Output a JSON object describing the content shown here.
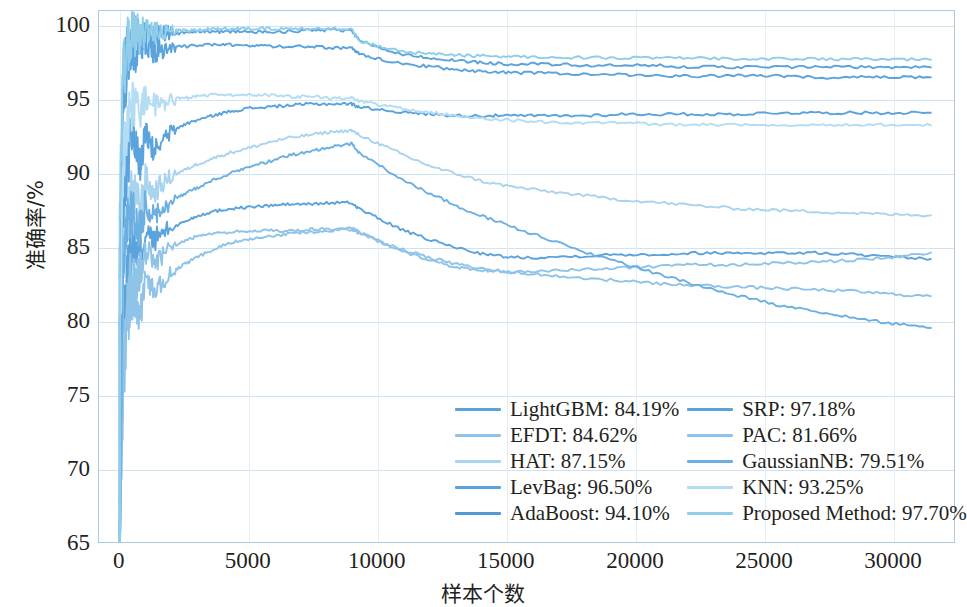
{
  "chart_data": {
    "type": "line",
    "title": "",
    "xlabel": "样本个数",
    "ylabel": "准确率/%",
    "xlim": [
      -800,
      32400
    ],
    "ylim": [
      65,
      101
    ],
    "grid": true,
    "legend_position": "lower-center-right",
    "xticks": [
      0,
      5000,
      10000,
      15000,
      20000,
      25000,
      30000
    ],
    "xtick_labels": [
      "0",
      "5000",
      "10000",
      "15000",
      "20000",
      "25000",
      "30000"
    ],
    "yticks": [
      65,
      70,
      75,
      80,
      85,
      90,
      95,
      100
    ],
    "ytick_labels": [
      "65",
      "70",
      "75",
      "80",
      "85",
      "90",
      "95",
      "100"
    ],
    "x": [
      0,
      150,
      300,
      450,
      600,
      800,
      1000,
      1300,
      1600,
      2000,
      2500,
      3000,
      3600,
      4300,
      5000,
      5800,
      6600,
      7400,
      8200,
      9000,
      9300,
      10200,
      11200,
      12200,
      13200,
      14200,
      15200,
      16500,
      18000,
      19500,
      21000,
      22500,
      24000,
      25500,
      27000,
      28500,
      30000,
      31500
    ],
    "series": [
      {
        "name": "LightGBM",
        "final_value": 84.19,
        "color": "#5ba3dc",
        "values": [
          65.0,
          80.5,
          83.2,
          84.9,
          85.0,
          84.2,
          86.0,
          85.4,
          85.9,
          86.3,
          86.7,
          87.1,
          87.4,
          87.6,
          87.7,
          87.8,
          87.9,
          87.9,
          88.0,
          88.0,
          87.6,
          86.8,
          86.0,
          85.4,
          84.9,
          84.5,
          84.3,
          84.3,
          84.4,
          84.5,
          84.5,
          84.6,
          84.6,
          84.6,
          84.6,
          84.5,
          84.3,
          84.19
        ]
      },
      {
        "name": "EFDT",
        "final_value": 84.62,
        "color": "#8fc4e8",
        "values": [
          65.0,
          78.0,
          81.4,
          83.1,
          82.6,
          83.4,
          84.9,
          84.0,
          84.3,
          85.0,
          85.4,
          85.7,
          85.9,
          86.0,
          86.1,
          86.1,
          86.1,
          86.2,
          86.2,
          86.3,
          86.0,
          85.3,
          84.6,
          84.0,
          83.6,
          83.4,
          83.3,
          83.4,
          83.5,
          83.6,
          83.7,
          83.8,
          83.8,
          83.9,
          84.0,
          84.1,
          84.3,
          84.62
        ]
      },
      {
        "name": "HAT",
        "final_value": 87.15,
        "color": "#a9d4ef",
        "values": [
          65.0,
          83.5,
          86.6,
          88.5,
          88.4,
          87.6,
          89.6,
          88.6,
          89.2,
          89.8,
          90.2,
          90.6,
          91.0,
          91.4,
          91.7,
          92.1,
          92.4,
          92.6,
          92.8,
          92.9,
          92.6,
          91.9,
          91.1,
          90.4,
          89.9,
          89.4,
          89.1,
          88.8,
          88.5,
          88.2,
          88.0,
          87.8,
          87.6,
          87.5,
          87.4,
          87.3,
          87.2,
          87.15
        ]
      },
      {
        "name": "LevBag",
        "final_value": 96.5,
        "color": "#5ba3dc",
        "values": [
          80.0,
          95.4,
          97.2,
          98.1,
          98.3,
          98.0,
          98.5,
          98.3,
          98.4,
          98.6,
          98.6,
          98.7,
          98.7,
          98.7,
          98.7,
          98.6,
          98.6,
          98.6,
          98.5,
          98.5,
          98.1,
          97.7,
          97.4,
          97.2,
          97.0,
          96.9,
          96.8,
          96.8,
          96.7,
          96.7,
          96.6,
          96.6,
          96.6,
          96.6,
          96.5,
          96.5,
          96.5,
          96.5
        ]
      },
      {
        "name": "AdaBoost",
        "final_value": 94.1,
        "color": "#5ba3dc",
        "values": [
          70.0,
          88.5,
          90.8,
          92.3,
          91.8,
          90.5,
          92.6,
          91.5,
          92.0,
          92.8,
          93.3,
          93.6,
          93.9,
          94.2,
          94.4,
          94.5,
          94.6,
          94.7,
          94.7,
          94.7,
          94.5,
          94.3,
          94.1,
          94.0,
          93.9,
          93.9,
          93.9,
          93.9,
          93.9,
          94.0,
          94.0,
          94.0,
          94.0,
          94.1,
          94.1,
          94.1,
          94.1,
          94.1
        ]
      },
      {
        "name": "SRP",
        "final_value": 97.18,
        "color": "#5ba3dc",
        "values": [
          85.0,
          96.5,
          98.2,
          99.0,
          99.2,
          99.1,
          99.4,
          99.3,
          99.4,
          99.5,
          99.5,
          99.6,
          99.6,
          99.6,
          99.6,
          99.6,
          99.6,
          99.7,
          99.7,
          99.7,
          99.0,
          98.4,
          98.0,
          97.8,
          97.6,
          97.5,
          97.4,
          97.4,
          97.3,
          97.3,
          97.3,
          97.2,
          97.2,
          97.2,
          97.2,
          97.2,
          97.2,
          97.18
        ]
      },
      {
        "name": "PAC",
        "final_value": 81.66,
        "color": "#8fc4e8",
        "values": [
          65.0,
          76.5,
          79.8,
          81.6,
          81.2,
          80.4,
          82.8,
          82.0,
          82.6,
          83.3,
          83.8,
          84.3,
          84.8,
          85.3,
          85.5,
          85.7,
          85.9,
          86.0,
          86.1,
          86.2,
          85.9,
          85.3,
          84.7,
          84.2,
          83.8,
          83.5,
          83.3,
          83.1,
          82.9,
          82.7,
          82.5,
          82.4,
          82.3,
          82.2,
          82.1,
          82.0,
          81.8,
          81.66
        ]
      },
      {
        "name": "GaussianNB",
        "final_value": 79.51,
        "color": "#6cb0e2",
        "values": [
          65.0,
          84.0,
          86.5,
          87.6,
          87.0,
          86.0,
          88.0,
          87.0,
          87.5,
          88.1,
          88.6,
          89.0,
          89.5,
          90.0,
          90.4,
          90.8,
          91.2,
          91.5,
          91.8,
          92.0,
          91.4,
          90.4,
          89.4,
          88.5,
          87.7,
          87.0,
          86.4,
          85.6,
          84.7,
          83.9,
          83.1,
          82.4,
          81.7,
          81.1,
          80.6,
          80.2,
          79.8,
          79.51
        ]
      },
      {
        "name": "KNN",
        "final_value": 93.25,
        "color": "#b4dcf3",
        "values": [
          78.0,
          91.0,
          93.2,
          94.4,
          94.6,
          94.2,
          94.9,
          94.6,
          94.8,
          95.0,
          95.1,
          95.2,
          95.3,
          95.3,
          95.3,
          95.3,
          95.2,
          95.2,
          95.1,
          95.1,
          94.9,
          94.6,
          94.3,
          94.1,
          93.9,
          93.7,
          93.6,
          93.5,
          93.4,
          93.4,
          93.3,
          93.3,
          93.3,
          93.3,
          93.3,
          93.3,
          93.3,
          93.25
        ]
      },
      {
        "name": "Proposed Method",
        "final_value": 97.7,
        "color": "#8fcdea",
        "values": [
          88.0,
          97.2,
          98.6,
          99.2,
          99.4,
          99.3,
          99.6,
          99.5,
          99.6,
          99.7,
          99.7,
          99.7,
          99.8,
          99.8,
          99.8,
          99.8,
          99.8,
          99.8,
          99.8,
          99.8,
          99.0,
          98.5,
          98.2,
          98.1,
          98.0,
          97.95,
          97.9,
          97.88,
          97.85,
          97.83,
          97.81,
          97.79,
          97.78,
          97.76,
          97.75,
          97.73,
          97.72,
          97.7
        ]
      }
    ]
  },
  "legend": {
    "columns": [
      {
        "entries": [
          {
            "label": "LightGBM: 84.19%",
            "color": "#5ba3dc"
          },
          {
            "label": "EFDT: 84.62%",
            "color": "#8fc4e8"
          },
          {
            "label": "HAT: 87.15%",
            "color": "#a9d4ef"
          },
          {
            "label": "LevBag: 96.50%",
            "color": "#5ba3dc"
          },
          {
            "label": "AdaBoost: 94.10%",
            "color": "#4d9bd8"
          }
        ]
      },
      {
        "entries": [
          {
            "label": "SRP: 97.18%",
            "color": "#5ba3dc"
          },
          {
            "label": "PAC: 81.66%",
            "color": "#8fc4e8"
          },
          {
            "label": "GaussianNB: 79.51%",
            "color": "#6cb0e2"
          },
          {
            "label": "KNN: 93.25%",
            "color": "#b4dcf3"
          },
          {
            "label": "Proposed Method: 97.70%",
            "color": "#8fcdea"
          }
        ]
      }
    ]
  }
}
